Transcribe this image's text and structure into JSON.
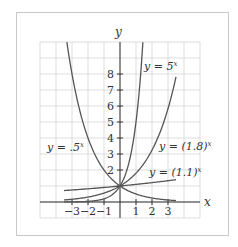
{
  "chart_data": {
    "type": "line",
    "title": "",
    "xlabel": "x",
    "ylabel": "y",
    "xlim": [
      -5,
      5
    ],
    "ylim": [
      -1,
      10
    ],
    "grid": true,
    "x_ticks": [
      -3,
      -2,
      -1,
      1,
      2,
      3
    ],
    "x_tick_labels": [
      "−3",
      "−2",
      "−1",
      "1",
      "2",
      "3"
    ],
    "y_ticks": [
      1,
      2,
      3,
      4,
      5,
      6,
      7,
      8
    ],
    "y_tick_labels": [
      "",
      "2",
      "3",
      "4",
      "5",
      "6",
      "7",
      "8"
    ],
    "series": [
      {
        "name": "y = 5^x",
        "base": 5,
        "domain": [
          -3.5,
          1.43
        ],
        "label": "y = 5",
        "label_exp": "x",
        "x": [
          -3.5,
          -3,
          -2,
          -1,
          0,
          0.5,
          1,
          1.2,
          1.43
        ],
        "values": [
          0.004,
          0.008,
          0.04,
          0.2,
          1,
          2.24,
          5,
          6.9,
          10
        ]
      },
      {
        "name": "y = (1.8)^x",
        "base": 1.8,
        "domain": [
          -3.5,
          3.5
        ],
        "label": "y = (1.8)",
        "label_exp": "x",
        "x": [
          -3.5,
          -3,
          -2,
          -1,
          0,
          1,
          2,
          3,
          3.5
        ],
        "values": [
          0.128,
          0.171,
          0.309,
          0.556,
          1,
          1.8,
          3.24,
          5.83,
          7.82
        ]
      },
      {
        "name": "y = (1.1)^x",
        "base": 1.1,
        "domain": [
          -3.5,
          3.5
        ],
        "label": "y = (1.1)",
        "label_exp": "x",
        "x": [
          -3.5,
          -3,
          -2,
          -1,
          0,
          1,
          2,
          3,
          3.5
        ],
        "values": [
          0.716,
          0.751,
          0.826,
          0.909,
          1,
          1.1,
          1.21,
          1.331,
          1.396
        ]
      },
      {
        "name": "y = .5^x",
        "base": 0.5,
        "domain": [
          -3.32,
          3.5
        ],
        "label": "y = .5",
        "label_exp": "x",
        "x": [
          -3.32,
          -3,
          -2,
          -1,
          0,
          1,
          2,
          3,
          3.5
        ],
        "values": [
          10,
          8,
          4,
          2,
          1,
          0.5,
          0.25,
          0.125,
          0.088
        ]
      }
    ]
  }
}
